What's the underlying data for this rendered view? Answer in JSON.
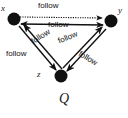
{
  "figure": {
    "caption": "Q",
    "type": "directed-graph",
    "nodes": [
      {
        "id": "x",
        "label": "x",
        "x": 14,
        "y": 18
      },
      {
        "id": "y",
        "label": "y",
        "x": 111,
        "y": 20
      },
      {
        "id": "z",
        "label": "z",
        "x": 60,
        "y": 76
      }
    ],
    "edges": [
      {
        "id": "x-y-dotted",
        "from": "x",
        "to": "y",
        "label": "follow",
        "style": "dotted",
        "arrow": "end"
      },
      {
        "id": "y-x-solid",
        "from": "y",
        "to": "x",
        "label": "follow",
        "style": "solid",
        "arrow": "both"
      },
      {
        "id": "x-z",
        "from": "x",
        "to": "z",
        "label": "follow",
        "style": "solid",
        "arrow": "end"
      },
      {
        "id": "z-x",
        "from": "z",
        "to": "x",
        "label": "follow",
        "style": "solid",
        "arrow": "end"
      },
      {
        "id": "y-z",
        "from": "y",
        "to": "z",
        "label": "follow",
        "style": "solid",
        "arrow": "end"
      },
      {
        "id": "z-y",
        "from": "z",
        "to": "y",
        "label": "follow",
        "style": "solid",
        "arrow": "end"
      }
    ],
    "colors": {
      "node": "#101010",
      "edge": "#111111",
      "text": "#1a1a1a",
      "background": "#ffffff"
    }
  }
}
